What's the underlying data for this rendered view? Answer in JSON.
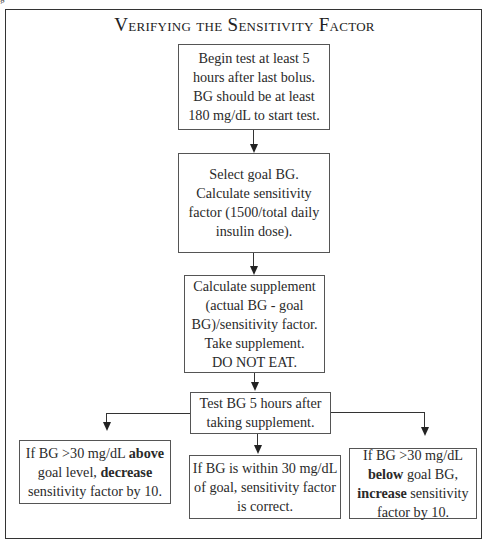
{
  "figure": {
    "label": "g",
    "title": "Verifying the Sensitivity Factor"
  },
  "steps": [
    {
      "id": "begin",
      "lines": [
        "Begin test at least 5",
        "hours after last bolus.",
        "BG should be at least",
        "180 mg/dL to start test."
      ]
    },
    {
      "id": "select-goal",
      "lines": [
        "Select goal BG.",
        "Calculate sensitivity",
        "factor (1500/total daily",
        "insulin dose)."
      ]
    },
    {
      "id": "calculate-supplement",
      "lines": [
        "Calculate supplement",
        "(actual BG - goal",
        "BG)/sensitivity factor.",
        "Take supplement.",
        "DO NOT EAT."
      ]
    },
    {
      "id": "test-bg",
      "lines": [
        "Test BG 5 hours after",
        "taking supplement."
      ]
    }
  ],
  "outcomes": {
    "above": {
      "line1_pre": "If BG >30 mg/dL ",
      "line1_bold": "above",
      "line2_pre": "goal level, ",
      "line2_bold": "decrease",
      "line3": "sensitivity factor by 10."
    },
    "within": {
      "lines": [
        "If BG is within 30 mg/dL",
        "of goal, sensitivity factor",
        "is correct."
      ]
    },
    "below": {
      "line1": "If BG >30 mg/dL",
      "line2_bold": "below",
      "line2_post": " goal BG,",
      "line3_bold": "increase",
      "line3_post": " sensitivity",
      "line4": "factor by 10."
    }
  },
  "colors": {
    "border": "#555555",
    "text": "#2a2a2a",
    "background": "#ffffff"
  }
}
